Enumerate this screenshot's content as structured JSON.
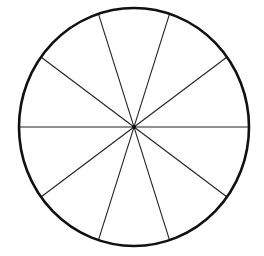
{
  "diagram": {
    "type": "divided-circle",
    "segments": 10,
    "diameters": 5,
    "segment_angle_deg": 36,
    "center": {
      "x": 134,
      "y": 127
    },
    "radius_x": 115,
    "radius_y": 119,
    "outline_color": "#111111",
    "line_color": "#222222",
    "background": "#ffffff",
    "outline_width": 2.6,
    "spoke_width": 1.1,
    "center_dot_radius": 2,
    "spoke_angles_deg": [
      0,
      36,
      72,
      108,
      144
    ]
  }
}
